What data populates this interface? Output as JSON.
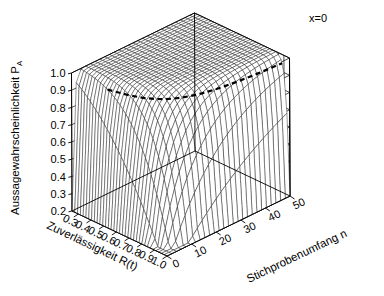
{
  "figure": {
    "kind": "3d-mesh-surface",
    "background": "#ffffff",
    "annotation": "x=0",
    "mesh_color": "#1a1a1a",
    "pane_color": "#000000",
    "contour_color": "#000000"
  },
  "axes": {
    "z": {
      "label_main": "Aussagewahrscheinlichkeit P",
      "label_sub": "A",
      "ticks": [
        "0.2",
        "0.3",
        "0.4",
        "0.5",
        "0.6",
        "0.7",
        "0.8",
        "0.9",
        "1.0"
      ],
      "values": [
        0.2,
        0.3,
        0.4,
        0.5,
        0.6,
        0.7,
        0.8,
        0.9,
        1.0
      ],
      "lim": [
        0.2,
        1.0
      ]
    },
    "x": {
      "label_main": "Zuverlässigkeit R(t)",
      "ticks": [
        "0.3",
        "0.4",
        "0.5",
        "0.6",
        "0.7",
        "0.8",
        "0.9",
        "1.0"
      ],
      "values": [
        0.3,
        0.4,
        0.5,
        0.6,
        0.7,
        0.8,
        0.9,
        1.0
      ],
      "lim": [
        0.25,
        1.0
      ]
    },
    "y": {
      "label_main": "Stichprobenumfang n",
      "ticks": [
        "0",
        "10",
        "20",
        "30",
        "40",
        "50"
      ],
      "values": [
        0,
        10,
        20,
        30,
        40,
        50
      ],
      "lim": [
        0,
        50
      ]
    }
  },
  "chart_data": {
    "type": "surface",
    "title": "",
    "subtitle": "",
    "xlabel": "Zuverlässigkeit R(t)",
    "ylabel": "Stichprobenumfang n",
    "zlabel": "Aussagewahrscheinlichkeit P_A",
    "annotations": [
      "x=0"
    ],
    "legend": [],
    "grid": true,
    "xlim": [
      0.25,
      1.0
    ],
    "ylim": [
      0,
      50
    ],
    "zlim": [
      0.2,
      1.0
    ],
    "formula": "P_A = 1 - R^n",
    "x": [
      0.25,
      0.3,
      0.35,
      0.4,
      0.45,
      0.5,
      0.55,
      0.6,
      0.65,
      0.7,
      0.75,
      0.8,
      0.85,
      0.9,
      0.95,
      1.0
    ],
    "y": [
      0,
      5,
      10,
      15,
      20,
      25,
      30,
      35,
      40,
      45,
      50
    ],
    "z_rows": [
      {
        "n": 0,
        "values": [
          0.2,
          0.2,
          0.2,
          0.2,
          0.2,
          0.2,
          0.2,
          0.2,
          0.2,
          0.2,
          0.2,
          0.2,
          0.2,
          0.2,
          0.2,
          0.2
        ]
      },
      {
        "n": 5,
        "values": [
          1.0,
          1.0,
          0.99,
          0.99,
          0.98,
          0.97,
          0.95,
          0.92,
          0.88,
          0.83,
          0.76,
          0.67,
          0.56,
          0.41,
          0.23,
          0.2
        ]
      },
      {
        "n": 10,
        "values": [
          1.0,
          1.0,
          1.0,
          1.0,
          1.0,
          1.0,
          1.0,
          0.99,
          0.99,
          0.97,
          0.94,
          0.89,
          0.8,
          0.65,
          0.4,
          0.2
        ]
      },
      {
        "n": 15,
        "values": [
          1.0,
          1.0,
          1.0,
          1.0,
          1.0,
          1.0,
          1.0,
          1.0,
          1.0,
          1.0,
          0.99,
          0.96,
          0.91,
          0.79,
          0.54,
          0.2
        ]
      },
      {
        "n": 20,
        "values": [
          1.0,
          1.0,
          1.0,
          1.0,
          1.0,
          1.0,
          1.0,
          1.0,
          1.0,
          1.0,
          1.0,
          0.99,
          0.96,
          0.88,
          0.64,
          0.2
        ]
      },
      {
        "n": 25,
        "values": [
          1.0,
          1.0,
          1.0,
          1.0,
          1.0,
          1.0,
          1.0,
          1.0,
          1.0,
          1.0,
          1.0,
          1.0,
          0.98,
          0.93,
          0.72,
          0.2
        ]
      },
      {
        "n": 30,
        "values": [
          1.0,
          1.0,
          1.0,
          1.0,
          1.0,
          1.0,
          1.0,
          1.0,
          1.0,
          1.0,
          1.0,
          1.0,
          0.99,
          0.96,
          0.79,
          0.2
        ]
      },
      {
        "n": 35,
        "values": [
          1.0,
          1.0,
          1.0,
          1.0,
          1.0,
          1.0,
          1.0,
          1.0,
          1.0,
          1.0,
          1.0,
          1.0,
          1.0,
          0.97,
          0.83,
          0.2
        ]
      },
      {
        "n": 40,
        "values": [
          1.0,
          1.0,
          1.0,
          1.0,
          1.0,
          1.0,
          1.0,
          1.0,
          1.0,
          1.0,
          1.0,
          1.0,
          1.0,
          0.99,
          0.87,
          0.2
        ]
      },
      {
        "n": 45,
        "values": [
          1.0,
          1.0,
          1.0,
          1.0,
          1.0,
          1.0,
          1.0,
          1.0,
          1.0,
          1.0,
          1.0,
          1.0,
          1.0,
          0.99,
          0.9,
          0.2
        ]
      },
      {
        "n": 50,
        "values": [
          1.0,
          1.0,
          1.0,
          1.0,
          1.0,
          1.0,
          1.0,
          1.0,
          1.0,
          1.0,
          1.0,
          1.0,
          1.0,
          0.99,
          0.92,
          0.2
        ]
      }
    ],
    "contour": {
      "level": 0.95,
      "style": "dashed",
      "width": 2.2
    }
  }
}
